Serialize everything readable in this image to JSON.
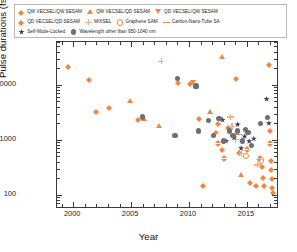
{
  "chart_data": {
    "type": "scatter",
    "title": "",
    "xlabel": "Year",
    "ylabel": "Pulse durations (fs)",
    "xlim": [
      1998.6,
      2017.6
    ],
    "ylim": [
      60,
      60000
    ],
    "yscale": "log",
    "xscale": "linear",
    "grid": false,
    "legend_position": "above-plot",
    "xticks": [
      "2000",
      "2005",
      "2010",
      "2015"
    ],
    "xtick_values": [
      2000,
      2005,
      2010,
      2015
    ],
    "yticks": [
      "100",
      "1000",
      "10000"
    ],
    "ytick_values": [
      100,
      1000,
      10000
    ],
    "series": [
      {
        "name": "QW VECSEL/QW SESAM",
        "marker": "diamond",
        "color": "#ef8743",
        "points": [
          [
            1999.6,
            22000
          ],
          [
            2001.4,
            13000
          ],
          [
            2002.0,
            3400
          ],
          [
            2003.1,
            3900
          ],
          [
            2005.6,
            2400
          ],
          [
            2009.1,
            11500
          ],
          [
            2010.1,
            11000
          ],
          [
            2011.2,
            150
          ],
          [
            2012.3,
            1400
          ],
          [
            2012.5,
            2050
          ],
          [
            2012.5,
            900
          ],
          [
            2012.9,
            680
          ],
          [
            2013.0,
            480
          ],
          [
            2013.4,
            1750
          ],
          [
            2014.1,
            13500
          ],
          [
            2014.3,
            600
          ],
          [
            2014.6,
            1000
          ],
          [
            2015.0,
            700
          ],
          [
            2015.3,
            170
          ],
          [
            2015.8,
            150
          ],
          [
            2016.1,
            480
          ],
          [
            2016.3,
            330
          ],
          [
            2016.4,
            210
          ],
          [
            2016.5,
            150
          ],
          [
            2016.9,
            24000
          ],
          [
            2017.0,
            1500
          ],
          [
            2017.0,
            900
          ],
          [
            2017.1,
            430
          ],
          [
            2017.1,
            300
          ],
          [
            2017.2,
            200
          ],
          [
            2017.2,
            140
          ],
          [
            2017.3,
            115
          ]
        ]
      },
      {
        "name": "QW VECSEL/QD SESAM",
        "marker": "triangle-up",
        "color": "#ef8743",
        "points": [
          [
            2004.9,
            5200
          ],
          [
            2006.1,
            2400
          ],
          [
            2007.4,
            1800
          ],
          [
            2011.8,
            3300
          ],
          [
            2012.9,
            33000
          ],
          [
            2014.5,
            230
          ]
        ]
      },
      {
        "name": "QD VECSEL/QW SESAM",
        "marker": "triangle-down",
        "color": "#ef8743",
        "points": [
          [
            2010.4,
            11000
          ]
        ]
      },
      {
        "name": "QD VECSEL/QD SESAM",
        "marker": "diamond",
        "color": "#ef8743",
        "points": [
          [
            2010.9,
            2500
          ]
        ]
      },
      {
        "name": "MIXSEL",
        "marker": "plus",
        "color": "#f3b183",
        "points": [
          [
            2007.6,
            27000
          ],
          [
            2013.6,
            2600
          ],
          [
            2013.7,
            1750
          ],
          [
            2014.0,
            1000
          ],
          [
            2014.5,
            560
          ],
          [
            2015.9,
            350
          ]
        ]
      },
      {
        "name": "Graphene SAM",
        "marker": "open-circle",
        "color": "#ef8743",
        "points": [
          [
            2014.9,
            520
          ],
          [
            2016.2,
            430
          ]
        ]
      },
      {
        "name": "Carbon-Nano-Tube SA",
        "marker": "dash",
        "color": "#ef8743",
        "points": [
          [
            2014.3,
            1250
          ]
        ]
      },
      {
        "name": "Self-Mode-Locked",
        "marker": "star",
        "color": "#3b3f63",
        "points": [
          [
            2012.9,
            2300
          ],
          [
            2013.2,
            950
          ],
          [
            2013.9,
            1100
          ],
          [
            2014.2,
            1900
          ],
          [
            2014.5,
            700
          ],
          [
            2014.8,
            1150
          ],
          [
            2015.2,
            940
          ],
          [
            2015.6,
            1050
          ],
          [
            2016.7,
            5500
          ],
          [
            2016.9,
            2000
          ]
        ]
      },
      {
        "name": "Wavelength other than 950-1040 nm",
        "marker": "filled-circle",
        "color": "#6d6f74",
        "points": [
          [
            2006.0,
            2600
          ],
          [
            2008.8,
            1200
          ],
          [
            2009.0,
            13000
          ],
          [
            2010.6,
            9500
          ],
          [
            2010.8,
            1450
          ],
          [
            2011.7,
            2250
          ],
          [
            2012.1,
            1200
          ],
          [
            2012.6,
            2400
          ],
          [
            2013.0,
            950
          ],
          [
            2013.5,
            1450
          ],
          [
            2013.8,
            1200
          ],
          [
            2014.2,
            1450
          ],
          [
            2014.6,
            950
          ],
          [
            2014.9,
            1550
          ],
          [
            2015.1,
            1350
          ],
          [
            2015.4,
            780
          ],
          [
            2016.2,
            1950
          ],
          [
            2016.8,
            2500
          ]
        ]
      }
    ]
  },
  "legend": {
    "rows": [
      [
        {
          "label": "QW VECSEL/QW SESAM",
          "marker": "diamond"
        },
        {
          "label": "QW VECSEL/QD SESAM",
          "marker": "triangle-up"
        },
        {
          "label": "QD VECSEL/QW SESAM",
          "marker": "triangle-down"
        }
      ],
      [
        {
          "label": "QD VECSEL/QD SESAM",
          "marker": "diamond"
        },
        {
          "label": "MIXSEL",
          "marker": "plus"
        },
        {
          "label": "Graphene SAM",
          "marker": "open-circle"
        },
        {
          "label": "Carbon-Nano-Tube SA",
          "marker": "dash"
        }
      ],
      [
        {
          "label": "Self-Mode-Locked",
          "marker": "star"
        },
        {
          "label": "Wavelength other than 950-1040 nm",
          "marker": "filled-circle"
        }
      ]
    ]
  }
}
